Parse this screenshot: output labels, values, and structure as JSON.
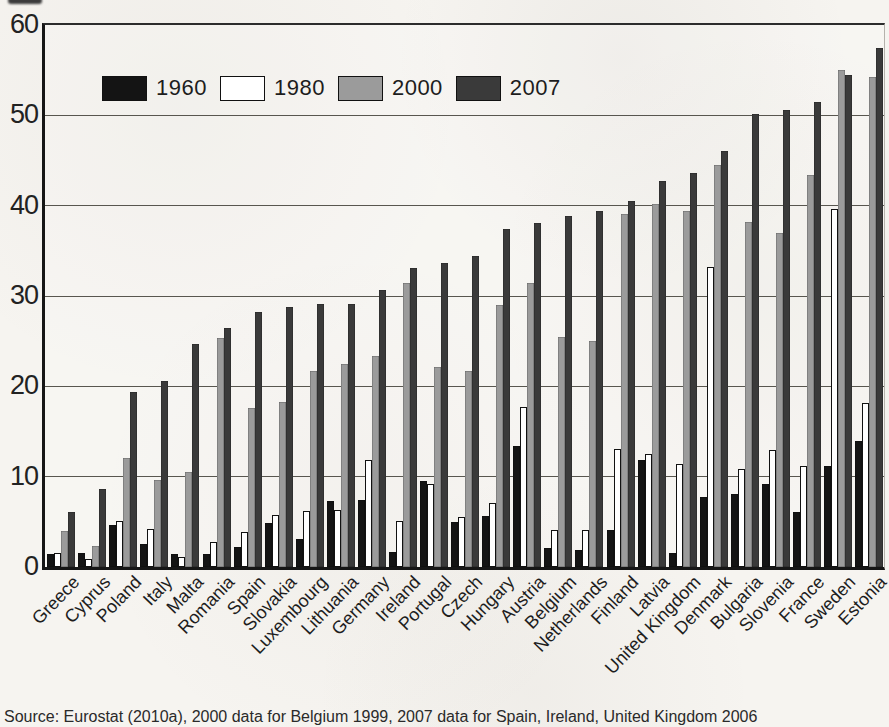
{
  "page": {
    "caption": "Source: Eurostat (2010a), 2000 data for Belgium 1999, 2007 data for Spain, Ireland, United Kingdom 2006"
  },
  "chart_data": {
    "type": "bar",
    "categories": [
      "Greece",
      "Cyprus",
      "Poland",
      "Italy",
      "Malta",
      "Romania",
      "Spain",
      "Slovakia",
      "Luxembourg",
      "Lithuania",
      "Germany",
      "Ireland",
      "Portugal",
      "Czech",
      "Hungary",
      "Austria",
      "Belgium",
      "Netherlands",
      "Finland",
      "Latvia",
      "United Kingdom",
      "Denmark",
      "Bulgaria",
      "Slovenia",
      "France",
      "Sweden",
      "Estonia"
    ],
    "series": [
      {
        "name": "1960",
        "color": "#141414",
        "values": [
          1.4,
          1.5,
          4.7,
          2.5,
          1.4,
          1.4,
          2.2,
          4.9,
          3.1,
          7.3,
          7.4,
          1.7,
          9.5,
          5.0,
          5.6,
          13.4,
          2.1,
          1.9,
          4.1,
          11.9,
          1.5,
          7.8,
          8.1,
          9.2,
          6.1,
          11.2,
          13.9
        ]
      },
      {
        "name": "1980",
        "color": "#ffffff",
        "values": [
          1.6,
          0.9,
          5.1,
          4.2,
          1.1,
          2.8,
          3.9,
          5.8,
          6.2,
          6.3,
          11.9,
          5.1,
          9.2,
          5.5,
          7.1,
          17.7,
          4.1,
          4.1,
          13.1,
          12.5,
          11.4,
          33.2,
          10.9,
          13.0,
          11.2,
          39.6,
          18.2
        ]
      },
      {
        "name": "2000",
        "color": "#9b9b9b",
        "values": [
          4.0,
          2.3,
          12.1,
          9.6,
          10.5,
          25.4,
          17.6,
          18.3,
          21.7,
          22.5,
          23.4,
          31.4,
          22.1,
          21.7,
          29.0,
          31.4,
          25.5,
          25.0,
          39.1,
          40.2,
          39.4,
          44.5,
          38.2,
          37.0,
          43.4,
          55.0,
          54.3
        ]
      },
      {
        "name": "2007",
        "color": "#3a3a3a",
        "values": [
          6.1,
          8.6,
          19.4,
          20.6,
          24.7,
          26.5,
          28.2,
          28.8,
          29.1,
          29.1,
          30.7,
          33.1,
          33.6,
          34.4,
          37.4,
          38.1,
          38.9,
          39.4,
          40.5,
          42.7,
          43.6,
          46.0,
          50.1,
          50.6,
          51.5,
          54.5,
          57.5
        ]
      }
    ],
    "title": "",
    "xlabel": "",
    "ylabel": "",
    "ylim": [
      0,
      60
    ],
    "yticks": [
      0,
      10,
      20,
      30,
      40,
      50,
      60
    ],
    "grid": true,
    "legend_position": "top-left"
  }
}
